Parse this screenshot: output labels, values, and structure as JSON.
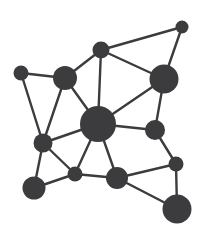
{
  "figure": {
    "type": "node-link-diagram",
    "background_color": "#ffffff",
    "node_color": "#3c3c3e",
    "edge_color": "#3c3c3e",
    "width": 206,
    "height": 241
  },
  "chart_data": {
    "type": "scatter",
    "subtitle": "",
    "xlabel": "",
    "ylabel": "",
    "xlim": [
      0,
      206
    ],
    "ylim": [
      0,
      241
    ],
    "grid": false,
    "legend": null,
    "annotations": [],
    "nodes": [
      {
        "id": "n1",
        "label": "top-right-small",
        "x": 182,
        "y": 27,
        "r": 6.5,
        "degree": 2
      },
      {
        "id": "n2",
        "label": "top-center",
        "x": 101,
        "y": 50,
        "r": 8.5,
        "degree": 4
      },
      {
        "id": "n3",
        "label": "left-upper-small",
        "x": 21,
        "y": 73,
        "r": 7.5,
        "degree": 2
      },
      {
        "id": "n4",
        "label": "upper-left-medium",
        "x": 65,
        "y": 78,
        "r": 12.0,
        "degree": 4
      },
      {
        "id": "n5",
        "label": "right-upper-large",
        "x": 164,
        "y": 79,
        "r": 14.5,
        "degree": 4
      },
      {
        "id": "n6",
        "label": "center-hub",
        "x": 98,
        "y": 124,
        "r": 18.0,
        "degree": 8
      },
      {
        "id": "n7",
        "label": "right-middle",
        "x": 155,
        "y": 130,
        "r": 10.0,
        "degree": 3
      },
      {
        "id": "n8",
        "label": "left-middle",
        "x": 43,
        "y": 143,
        "r": 9.5,
        "degree": 5
      },
      {
        "id": "n9",
        "label": "right-lower-small",
        "x": 176,
        "y": 164,
        "r": 7.5,
        "degree": 3
      },
      {
        "id": "n10",
        "label": "bottom-center-small",
        "x": 75,
        "y": 174,
        "r": 7.5,
        "degree": 4
      },
      {
        "id": "n11",
        "label": "bottom-center",
        "x": 117,
        "y": 178,
        "r": 11.0,
        "degree": 4
      },
      {
        "id": "n12",
        "label": "bottom-left-medium",
        "x": 34,
        "y": 188,
        "r": 11.5,
        "degree": 2
      },
      {
        "id": "n13",
        "label": "bottom-right-large",
        "x": 177,
        "y": 209,
        "r": 14.5,
        "degree": 2
      }
    ],
    "edges": [
      {
        "source": "n1",
        "target": "n2"
      },
      {
        "source": "n1",
        "target": "n5"
      },
      {
        "source": "n2",
        "target": "n4"
      },
      {
        "source": "n2",
        "target": "n5"
      },
      {
        "source": "n2",
        "target": "n6"
      },
      {
        "source": "n3",
        "target": "n4"
      },
      {
        "source": "n3",
        "target": "n8"
      },
      {
        "source": "n4",
        "target": "n6"
      },
      {
        "source": "n4",
        "target": "n8"
      },
      {
        "source": "n5",
        "target": "n6"
      },
      {
        "source": "n5",
        "target": "n7"
      },
      {
        "source": "n6",
        "target": "n7"
      },
      {
        "source": "n6",
        "target": "n8"
      },
      {
        "source": "n6",
        "target": "n10"
      },
      {
        "source": "n6",
        "target": "n11"
      },
      {
        "source": "n7",
        "target": "n9"
      },
      {
        "source": "n8",
        "target": "n10"
      },
      {
        "source": "n8",
        "target": "n12"
      },
      {
        "source": "n9",
        "target": "n11"
      },
      {
        "source": "n9",
        "target": "n13"
      },
      {
        "source": "n10",
        "target": "n11"
      },
      {
        "source": "n10",
        "target": "n12"
      },
      {
        "source": "n11",
        "target": "n13"
      }
    ],
    "node_count": 13,
    "edge_count": 23
  }
}
